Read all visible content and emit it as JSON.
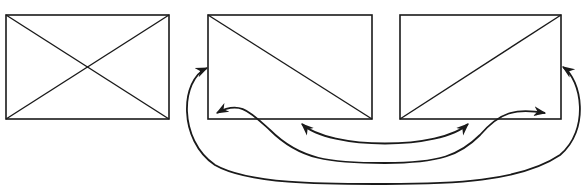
{
  "diagram": {
    "title": "",
    "stroke_color": "#1a1a1a",
    "background": "#ffffff",
    "panels": [
      {
        "id": "panel-1",
        "x": 6,
        "y": 15,
        "w": 163,
        "h": 104,
        "diagonals": "both",
        "label": ""
      },
      {
        "id": "panel-2",
        "x": 208,
        "y": 15,
        "w": 164,
        "h": 104,
        "diagonals": "top-left-to-bottom-right",
        "label": ""
      },
      {
        "id": "panel-3",
        "x": 400,
        "y": 15,
        "w": 161,
        "h": 104,
        "diagonals": "bottom-left-to-top-right",
        "label": ""
      }
    ],
    "arrows": [
      {
        "id": "inner-arrow",
        "from": "panel-2 bottom edge",
        "to": "panel-3 bottom edge",
        "heads": "both",
        "description": "shallow arc connecting bottom edges of panel 2 and panel 3"
      },
      {
        "id": "middle-arrow",
        "from": "panel-2 bottom-left corner",
        "to": "panel-3 bottom-right corner",
        "heads": "both",
        "description": "S-shaped curve connecting lower-left of panel 2 to lower-right of panel 3"
      },
      {
        "id": "outer-arrow",
        "from": "panel-2 left edge",
        "to": "panel-3 right edge",
        "heads": "both",
        "description": "large loop around both panels connecting left side of panel 2 to right side of panel 3"
      }
    ]
  }
}
